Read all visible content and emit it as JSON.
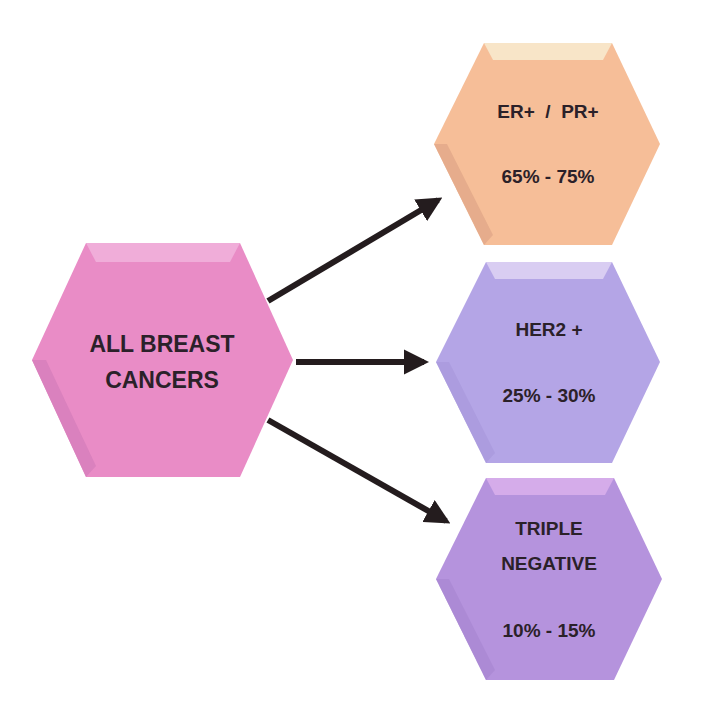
{
  "diagram": {
    "source": {
      "lines": [
        "ALL BREAST",
        "CANCERS"
      ],
      "color": "#e98cc6",
      "bevel_color": "#f0add9",
      "side_color": "#d77fbc"
    },
    "subtypes": [
      {
        "label_lines": [
          "ER+  /  PR+"
        ],
        "percentage": "65% - 75%",
        "color": "#f6be98",
        "bevel_color": "#f8e5c8",
        "side_color": "#e3a98a"
      },
      {
        "label_lines": [
          "HER2 +"
        ],
        "percentage": "25% - 30%",
        "color": "#b4a5e6",
        "bevel_color": "#d9cdf2",
        "side_color": "#a898dc"
      },
      {
        "label_lines": [
          "TRIPLE",
          "NEGATIVE"
        ],
        "percentage": "10% - 15%",
        "color": "#b593dd",
        "bevel_color": "#d5acea",
        "side_color": "#a886d2"
      }
    ],
    "arrow_color": "#241c1e"
  }
}
